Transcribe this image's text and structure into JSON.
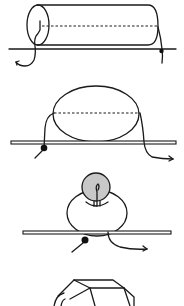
{
  "diagram": {
    "panels": [
      {
        "id": 1,
        "subject": "horizontal cylinder on a line with thread entering end cap"
      },
      {
        "id": 2,
        "subject": "oval loop above a bar with knot below"
      },
      {
        "id": 3,
        "subject": "gray sphere on a ring above a bar with knot below"
      },
      {
        "id": 4,
        "subject": "faceted polyhedral bead (partially visible)"
      }
    ],
    "colors": {
      "line": "#1a1a1a",
      "background": "#ffffff",
      "sphere_fill": "#c8c8c8",
      "knot": "#111111"
    }
  }
}
